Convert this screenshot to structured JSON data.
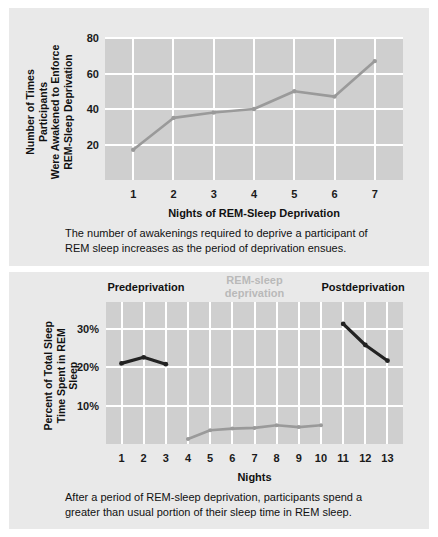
{
  "figure": {
    "background_color": "#ffffff",
    "panel_color": "#e9e9e9",
    "plot_color": "#cfcfcf",
    "grid_color": "#ffffff"
  },
  "top_chart": {
    "y_axis_title": "Number of Times Participants\nWere Awakened to Enforce\nREM-Sleep Deprivation",
    "x_axis_title": "Nights of REM-Sleep Deprivation",
    "y_ticks": [
      "20",
      "40",
      "60",
      "80"
    ],
    "x_ticks": [
      "1",
      "2",
      "3",
      "4",
      "5",
      "6",
      "7"
    ],
    "series_color": "#9a9a9a",
    "caption": "The number of awakenings required to deprive a participant of REM sleep increases as the period of deprivation ensues."
  },
  "bottom_chart": {
    "y_axis_title": "Percent of Total Sleep\nTime Spent in REM Sleep",
    "x_axis_title": "Nights",
    "y_ticks": [
      "10%",
      "20%",
      "30%"
    ],
    "x_ticks": [
      "1",
      "2",
      "3",
      "4",
      "5",
      "6",
      "7",
      "8",
      "9",
      "10",
      "11",
      "12",
      "13"
    ],
    "section_labels": [
      {
        "text": "Predeprivation",
        "color": "#111111"
      },
      {
        "text": "REM-sleep\ndeprivation",
        "color": "#b9b9b9"
      },
      {
        "text": "Postdeprivation",
        "color": "#111111"
      }
    ],
    "series_colors": {
      "predeprivation": "#222222",
      "deprivation": "#9a9a9a",
      "postdeprivation": "#222222"
    },
    "caption": "After a period of REM-sleep deprivation, participants spend a greater than usual portion of their sleep time in REM sleep."
  },
  "chart_data": [
    {
      "type": "line",
      "id": "awakenings-per-night",
      "title": "",
      "xlabel": "Nights of REM-Sleep Deprivation",
      "ylabel": "Number of Times Participants Were Awakened to Enforce REM-Sleep Deprivation",
      "x": [
        1,
        2,
        3,
        4,
        5,
        6,
        7
      ],
      "xticklabels": [
        "1",
        "2",
        "3",
        "4",
        "5",
        "6",
        "7"
      ],
      "yticklabels": [
        "20",
        "40",
        "60",
        "80"
      ],
      "yticks": [
        20,
        40,
        60,
        80
      ],
      "xlim": [
        0.3,
        7.7
      ],
      "ylim": [
        0,
        80
      ],
      "grid": true,
      "legend": "none",
      "series": [
        {
          "name": "Awakenings",
          "color": "#9a9a9a",
          "markers": true,
          "values": [
            17,
            35,
            38,
            40,
            50,
            47,
            67
          ]
        }
      ]
    },
    {
      "type": "line",
      "id": "percent-rem-sleep-by-night",
      "title": "",
      "xlabel": "Nights",
      "ylabel": "Percent of Total Sleep Time Spent in REM Sleep",
      "x": [
        1,
        2,
        3,
        4,
        5,
        6,
        7,
        8,
        9,
        10,
        11,
        12,
        13
      ],
      "xticklabels": [
        "1",
        "2",
        "3",
        "4",
        "5",
        "6",
        "7",
        "8",
        "9",
        "10",
        "11",
        "12",
        "13"
      ],
      "yticklabels": [
        "10%",
        "20%",
        "30%"
      ],
      "yticks": [
        10,
        20,
        30
      ],
      "xlim": [
        0.3,
        13.7
      ],
      "ylim": [
        0,
        37
      ],
      "grid": true,
      "legend": "none",
      "annotations": [
        "Predeprivation",
        "REM-sleep deprivation",
        "Postdeprivation"
      ],
      "series": [
        {
          "name": "Predeprivation",
          "color": "#222222",
          "markers": true,
          "x": [
            1,
            2,
            3
          ],
          "values": [
            21.0,
            22.6,
            20.8
          ]
        },
        {
          "name": "REM-sleep deprivation",
          "color": "#9a9a9a",
          "markers": true,
          "x": [
            4,
            5,
            6,
            7,
            8,
            9,
            10
          ],
          "values": [
            1.3,
            3.6,
            4.0,
            4.2,
            4.9,
            4.4,
            4.9
          ]
        },
        {
          "name": "Postdeprivation",
          "color": "#222222",
          "markers": true,
          "x": [
            11,
            12,
            13
          ],
          "values": [
            31.3,
            25.8,
            21.7
          ]
        }
      ]
    }
  ]
}
